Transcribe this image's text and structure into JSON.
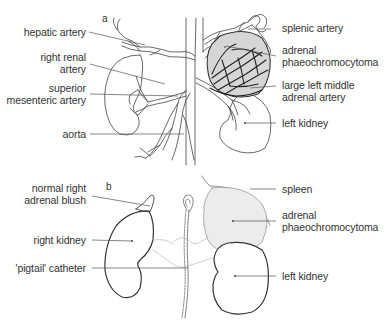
{
  "figure": {
    "panel_a": {
      "letter": "a",
      "labels_left": {
        "hepatic_artery": "hepatic artery",
        "right_renal_artery_1": "right renal",
        "right_renal_artery_2": "artery",
        "superior_mesenteric_1": "superior",
        "superior_mesenteric_2": "mesenteric artery",
        "aorta": "aorta"
      },
      "labels_right": {
        "splenic_artery": "splenic artery",
        "adrenal_phaeo_1": "adrenal",
        "adrenal_phaeo_2": "phaeochromocytoma",
        "left_middle_adrenal_1": "large left middle",
        "left_middle_adrenal_2": "adrenal artery",
        "left_kidney": "left kidney"
      }
    },
    "panel_b": {
      "letter": "b",
      "labels_left": {
        "adrenal_blush_1": "normal right",
        "adrenal_blush_2": "adrenal blush",
        "right_kidney": "right kidney",
        "pigtail_catheter": "'pigtail' catheter"
      },
      "labels_right": {
        "spleen": "spleen",
        "adrenal_phaeo_1": "adrenal",
        "adrenal_phaeo_2": "phaeochromocytoma",
        "left_kidney": "left kidney"
      }
    },
    "colors": {
      "line": "#444444",
      "leader": "#555555",
      "tumour_fill": "#d9d9d9",
      "tumour_fill_b": "#ececec",
      "text": "#333333"
    }
  }
}
